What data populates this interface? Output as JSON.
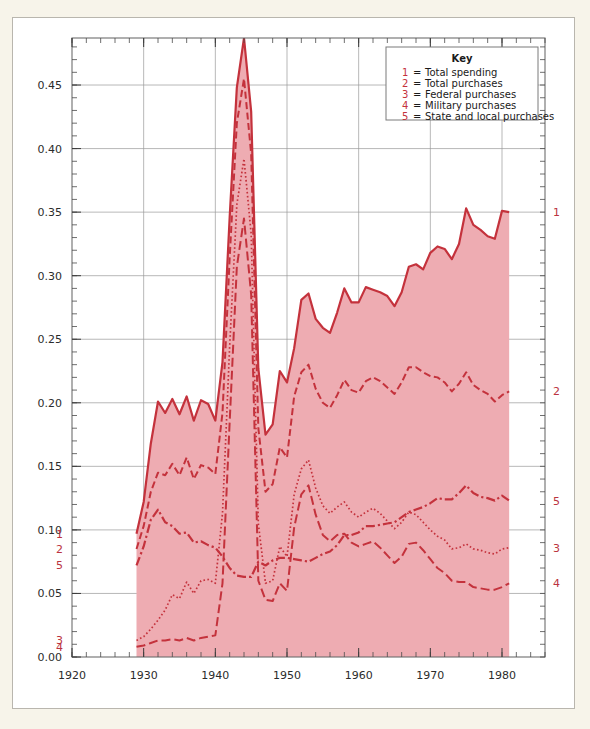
{
  "page": {
    "background_color": "#f7f4ea",
    "card_color": "#ffffff",
    "card_border_color": "#b9b6ae"
  },
  "chart_data": {
    "type": "line",
    "title": "",
    "subtitle": "",
    "xlabel": "",
    "ylabel": "",
    "xlim": [
      1920,
      1986
    ],
    "ylim": [
      0.0,
      0.487
    ],
    "grid": true,
    "legend_position": "top-right",
    "fill_color": "#eeacb2",
    "line_color": "#c4323c",
    "fill_series": "Total spending",
    "fill_start_year": 1929,
    "fill_end_year": 1981,
    "xticks": [
      1920,
      1930,
      1940,
      1950,
      1960,
      1970,
      1980
    ],
    "xtick_labels": [
      "1920",
      "1930",
      "1940",
      "1950",
      "1960",
      "1970",
      "1980"
    ],
    "yticks": [
      0.0,
      0.05,
      0.1,
      0.15,
      0.2,
      0.25,
      0.3,
      0.35,
      0.4,
      0.45
    ],
    "ytick_labels": [
      "0.00",
      "0.05",
      "0.10",
      "0.15",
      "0.20",
      "0.25",
      "0.30",
      "0.35",
      "0.40",
      "0.45"
    ],
    "x": [
      1929,
      1930,
      1931,
      1932,
      1933,
      1934,
      1935,
      1936,
      1937,
      1938,
      1939,
      1940,
      1941,
      1942,
      1943,
      1944,
      1945,
      1946,
      1947,
      1948,
      1949,
      1950,
      1951,
      1952,
      1953,
      1954,
      1955,
      1956,
      1957,
      1958,
      1959,
      1960,
      1961,
      1962,
      1963,
      1964,
      1965,
      1966,
      1967,
      1968,
      1969,
      1970,
      1971,
      1972,
      1973,
      1974,
      1975,
      1976,
      1977,
      1978,
      1979,
      1980,
      1981
    ],
    "series": [
      {
        "name": "Total spending",
        "key": "1",
        "style": "solid",
        "left_label": "1",
        "right_label": "1",
        "values": [
          0.097,
          0.122,
          0.168,
          0.201,
          0.192,
          0.203,
          0.191,
          0.205,
          0.186,
          0.202,
          0.199,
          0.186,
          0.232,
          0.346,
          0.448,
          0.487,
          0.429,
          0.227,
          0.175,
          0.183,
          0.225,
          0.216,
          0.243,
          0.281,
          0.286,
          0.266,
          0.259,
          0.255,
          0.271,
          0.29,
          0.279,
          0.279,
          0.291,
          0.289,
          0.287,
          0.284,
          0.276,
          0.287,
          0.307,
          0.309,
          0.305,
          0.318,
          0.323,
          0.321,
          0.313,
          0.325,
          0.353,
          0.34,
          0.336,
          0.331,
          0.329,
          0.351,
          0.35
        ]
      },
      {
        "name": "Total purchases",
        "key": "2",
        "style": "dashed",
        "left_label": "2",
        "right_label": "2",
        "values": [
          0.085,
          0.103,
          0.13,
          0.145,
          0.143,
          0.152,
          0.143,
          0.157,
          0.14,
          0.151,
          0.149,
          0.144,
          0.192,
          0.314,
          0.42,
          0.455,
          0.396,
          0.18,
          0.13,
          0.136,
          0.165,
          0.157,
          0.205,
          0.224,
          0.23,
          0.211,
          0.2,
          0.196,
          0.206,
          0.218,
          0.21,
          0.208,
          0.217,
          0.22,
          0.217,
          0.212,
          0.207,
          0.216,
          0.228,
          0.228,
          0.224,
          0.221,
          0.22,
          0.216,
          0.209,
          0.215,
          0.224,
          0.214,
          0.21,
          0.207,
          0.201,
          0.206,
          0.209
        ]
      },
      {
        "name": "Federal purchases",
        "key": "3",
        "style": "dotted",
        "left_label": "3",
        "right_label": "3",
        "values": [
          0.013,
          0.016,
          0.022,
          0.029,
          0.037,
          0.049,
          0.046,
          0.059,
          0.05,
          0.06,
          0.061,
          0.058,
          0.113,
          0.244,
          0.356,
          0.392,
          0.333,
          0.105,
          0.058,
          0.06,
          0.087,
          0.079,
          0.128,
          0.148,
          0.155,
          0.133,
          0.119,
          0.113,
          0.118,
          0.122,
          0.114,
          0.11,
          0.114,
          0.117,
          0.113,
          0.107,
          0.101,
          0.106,
          0.114,
          0.112,
          0.106,
          0.1,
          0.095,
          0.092,
          0.085,
          0.086,
          0.089,
          0.085,
          0.084,
          0.082,
          0.081,
          0.085,
          0.086
        ]
      },
      {
        "name": "Military purchases",
        "key": "4",
        "style": "dash-long",
        "left_label": "4",
        "right_label": "4",
        "values": [
          0.008,
          0.009,
          0.011,
          0.013,
          0.013,
          0.014,
          0.013,
          0.015,
          0.013,
          0.015,
          0.016,
          0.017,
          0.058,
          0.185,
          0.307,
          0.345,
          0.285,
          0.06,
          0.045,
          0.044,
          0.058,
          0.052,
          0.102,
          0.128,
          0.135,
          0.112,
          0.096,
          0.091,
          0.096,
          0.097,
          0.09,
          0.087,
          0.089,
          0.091,
          0.086,
          0.08,
          0.074,
          0.079,
          0.089,
          0.09,
          0.084,
          0.077,
          0.07,
          0.066,
          0.06,
          0.059,
          0.059,
          0.055,
          0.054,
          0.053,
          0.053,
          0.055,
          0.058
        ]
      },
      {
        "name": "State and local purchases",
        "key": "5",
        "style": "dash-dot",
        "left_label": "5",
        "right_label": "5",
        "values": [
          0.072,
          0.087,
          0.108,
          0.116,
          0.106,
          0.103,
          0.097,
          0.098,
          0.09,
          0.091,
          0.088,
          0.086,
          0.079,
          0.07,
          0.064,
          0.063,
          0.063,
          0.075,
          0.072,
          0.076,
          0.078,
          0.078,
          0.077,
          0.076,
          0.075,
          0.078,
          0.081,
          0.083,
          0.088,
          0.096,
          0.096,
          0.098,
          0.103,
          0.103,
          0.104,
          0.105,
          0.106,
          0.11,
          0.114,
          0.116,
          0.118,
          0.121,
          0.125,
          0.124,
          0.124,
          0.129,
          0.135,
          0.129,
          0.126,
          0.125,
          0.123,
          0.127,
          0.123
        ]
      }
    ]
  },
  "key": {
    "title": "Key",
    "separator": "=",
    "entries": [
      {
        "num": "1",
        "label": "Total spending"
      },
      {
        "num": "2",
        "label": "Total purchases"
      },
      {
        "num": "3",
        "label": "Federal purchases"
      },
      {
        "num": "4",
        "label": "Military purchases"
      },
      {
        "num": "5",
        "label": "State and local purchases"
      }
    ]
  },
  "axis_tags": {
    "left": [
      {
        "num": "1",
        "value": 0.097
      },
      {
        "num": "2",
        "value": 0.085
      },
      {
        "num": "5",
        "value": 0.072
      },
      {
        "num": "3",
        "value": 0.013
      },
      {
        "num": "4",
        "value": 0.008
      }
    ],
    "right": [
      {
        "num": "1",
        "value": 0.35
      },
      {
        "num": "2",
        "value": 0.209
      },
      {
        "num": "5",
        "value": 0.123
      },
      {
        "num": "3",
        "value": 0.086
      },
      {
        "num": "4",
        "value": 0.058
      }
    ]
  }
}
